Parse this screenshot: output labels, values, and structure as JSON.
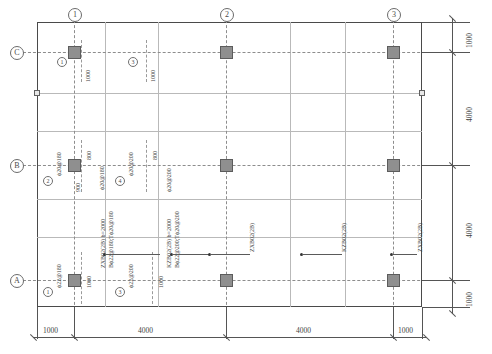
{
  "drawing": {
    "title": "Foundation Slab Reinforcement Plan",
    "grid_columns": [
      "1",
      "2",
      "3"
    ],
    "grid_rows": [
      "C",
      "B",
      "A"
    ],
    "dim_bottom": [
      "1000",
      "4000",
      "4000",
      "1000"
    ],
    "dim_right": [
      "1000",
      "4000",
      "4000",
      "1000"
    ],
    "colors": {
      "line": "#555555",
      "grid": "#8d8d8d",
      "column_fill": "#8f8f8f",
      "column_stroke": "#5c5c5c",
      "text": "#3f3f3f"
    }
  },
  "callouts": {
    "c1_mark": "1",
    "c1_dim": "1000",
    "c3_mark": "3",
    "c3_dim": "1000",
    "b2_mark": "2",
    "b2_spec": "ϕ20@180",
    "b2_above": "800",
    "b2_below": "900",
    "b4_mark": "4",
    "b4_spec": "ϕ20@200",
    "b4_above": "800",
    "b4_below": "ϕ20@200",
    "a1_mark": "1",
    "a1_spec": "ϕ22@180",
    "a1_dim": "1000",
    "a3_mark": "3",
    "a3_spec": "ϕ22@200",
    "a3_dim": "1000",
    "b_mid_left_spec": "ϕ20@180",
    "b_mid_right_spec": "ϕ20@200"
  },
  "beam_labels": {
    "left_name": "ZXB02(2B) b=2000",
    "left_rebar": "Bϕ22@180;Tϕ20@180",
    "mid_name": "KZB02(2B) b=2000",
    "mid_rebar": "Bϕ22@200;Tϕ20@200",
    "r1": "ZXB02(2B)",
    "r2": "KZB02(2B)",
    "r3": "ZXB02(2B)"
  }
}
